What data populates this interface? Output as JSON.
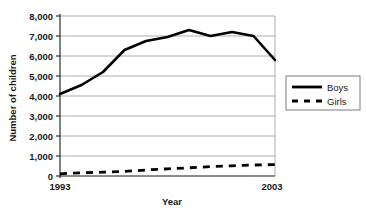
{
  "chart_data": {
    "type": "line",
    "title": "",
    "xlabel": "Year",
    "ylabel": "Number of children",
    "x": [
      1993,
      1994,
      1995,
      1996,
      1997,
      1998,
      1999,
      2000,
      2001,
      2002,
      2003
    ],
    "xtick_labels": [
      "1993",
      "2003"
    ],
    "xlim": [
      1993,
      2003
    ],
    "ylim": [
      0,
      8000
    ],
    "ytick_labels": [
      "0",
      "1,000",
      "2,000",
      "3,000",
      "4,000",
      "5,000",
      "6,000",
      "7,000",
      "8,000"
    ],
    "ytick_values": [
      0,
      1000,
      2000,
      3000,
      4000,
      5000,
      6000,
      7000,
      8000
    ],
    "grid": true,
    "legend_position": "right",
    "series": [
      {
        "name": "Boys",
        "style": "solid",
        "color": "#000000",
        "values": [
          4100,
          4550,
          5200,
          6300,
          6750,
          6950,
          7300,
          7000,
          7200,
          7000,
          5800
        ]
      },
      {
        "name": "Girls",
        "style": "dashed",
        "color": "#000000",
        "values": [
          110,
          160,
          190,
          230,
          300,
          360,
          410,
          470,
          510,
          550,
          570
        ]
      }
    ]
  },
  "legend": {
    "items": [
      {
        "label": "Boys",
        "style": "solid"
      },
      {
        "label": "Girls",
        "style": "dashed"
      }
    ]
  }
}
